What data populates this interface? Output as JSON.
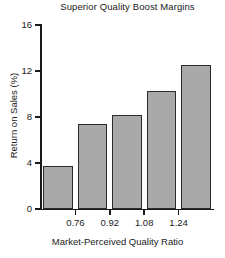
{
  "chart_data": {
    "type": "bar",
    "title": "Superior Quality Boost Margins",
    "xlabel": "Market-Perceived Quality Ratio",
    "ylabel": "Return on Sales (%)",
    "categories": [
      "",
      "0.76",
      "0.92",
      "1.08",
      "1.24"
    ],
    "values": [
      3.7,
      7.4,
      8.2,
      10.3,
      12.5
    ],
    "ylim": [
      0,
      16
    ],
    "yticks": [
      "0",
      "4",
      "8",
      "12",
      "16"
    ],
    "ytick_values": [
      0,
      4,
      8,
      12,
      16
    ],
    "xticks": [
      "0.76",
      "0.92",
      "1.08",
      "1.24"
    ],
    "grid": false,
    "legend": false,
    "bar_color": "#a9a9a9",
    "bar_edge_color": "#2b2b2b",
    "axis_color": "#1a1a1a"
  }
}
